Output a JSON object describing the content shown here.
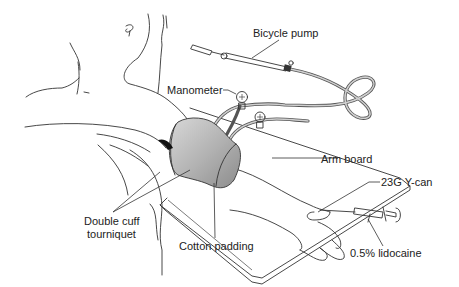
{
  "figure": {
    "labels": {
      "bicycle_pump": "Bicycle pump",
      "manometer": "Manometer",
      "arm_board": "Arm board",
      "cannula": "23G Y-can",
      "double_cuff_line1": "Double cuff",
      "double_cuff_line2": "tourniquet",
      "cotton_padding": "Cotton padding",
      "lidocaine": "0.5% lidocaine"
    },
    "colors": {
      "line": "#333333",
      "cuff_fill": "#b8b8b8",
      "tube": "#555555",
      "background": "#ffffff"
    }
  }
}
